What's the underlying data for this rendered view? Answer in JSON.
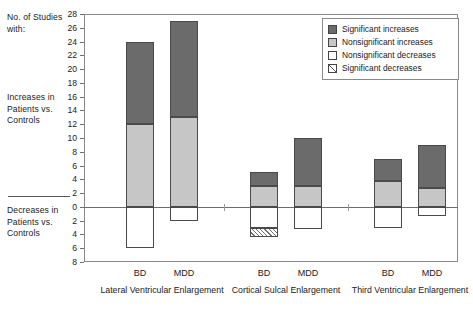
{
  "side_captions": {
    "top": "No. of Studies with:",
    "increases": "Increases in Patients vs. Controls",
    "decreases": "Decreases in Patients vs. Controls"
  },
  "legend": {
    "items": [
      {
        "label": "Significant increases",
        "key": "sig-inc",
        "color": "#6b6b6b"
      },
      {
        "label": "Nonsignificant increases",
        "key": "non-inc",
        "color": "#c6c6c6"
      },
      {
        "label": "Nonsignificant decreases",
        "key": "non-dec",
        "color": "#ffffff"
      },
      {
        "label": "Significant decreases",
        "key": "sig-dec",
        "color": "#ffffff"
      }
    ]
  },
  "chart_data": {
    "type": "bar",
    "title": "",
    "xlabel": "",
    "ylabel": "No. of Studies with:",
    "stacked": true,
    "grid": false,
    "legend_position": "top-right",
    "ylim": [
      -8,
      28
    ],
    "yticks": [
      28,
      26,
      24,
      22,
      20,
      18,
      16,
      14,
      12,
      10,
      8,
      6,
      4,
      2,
      0,
      2,
      4,
      6,
      8
    ],
    "ytick_values": [
      28,
      26,
      24,
      22,
      20,
      18,
      16,
      14,
      12,
      10,
      8,
      6,
      4,
      2,
      0,
      -2,
      -4,
      -6,
      -8
    ],
    "series": [
      {
        "name": "Significant increases",
        "values": [
          12,
          14,
          2,
          7,
          3.2,
          6.2
        ]
      },
      {
        "name": "Nonsignificant increases",
        "values": [
          12,
          13,
          3,
          3,
          3.8,
          2.8
        ]
      },
      {
        "name": "Nonsignificant decreases",
        "values": [
          -6,
          -2,
          -3,
          -3.2,
          -3,
          -1.3
        ]
      },
      {
        "name": "Significant decreases",
        "values": [
          0,
          0,
          -1.3,
          0,
          0,
          0
        ]
      }
    ],
    "categories": [
      "BD",
      "MDD",
      "BD",
      "MDD",
      "BD",
      "MDD"
    ],
    "groups": [
      {
        "label": "Lateral Ventricular Enlargement",
        "bars": [
          "BD",
          "MDD"
        ]
      },
      {
        "label": "Cortical Sulcal Enlargement",
        "bars": [
          "BD",
          "MDD"
        ]
      },
      {
        "label": "Third Ventricular Enlargement",
        "bars": [
          "BD",
          "MDD"
        ]
      }
    ],
    "bars": [
      {
        "group": "Lateral Ventricular Enlargement",
        "category": "BD",
        "sig_inc_top": 24,
        "non_inc_top": 12,
        "base": 0,
        "non_dec_bottom": -6,
        "sig_dec_bottom": -6
      },
      {
        "group": "Lateral Ventricular Enlargement",
        "category": "MDD",
        "sig_inc_top": 27,
        "non_inc_top": 13,
        "base": 0,
        "non_dec_bottom": -2,
        "sig_dec_bottom": -2
      },
      {
        "group": "Cortical Sulcal Enlargement",
        "category": "BD",
        "sig_inc_top": 5,
        "non_inc_top": 3,
        "base": 0,
        "non_dec_bottom": -3,
        "sig_dec_bottom": -4.3
      },
      {
        "group": "Cortical Sulcal Enlargement",
        "category": "MDD",
        "sig_inc_top": 10,
        "non_inc_top": 3,
        "base": 0,
        "non_dec_bottom": -3.2,
        "sig_dec_bottom": -3.2
      },
      {
        "group": "Third Ventricular Enlargement",
        "category": "BD",
        "sig_inc_top": 7,
        "non_inc_top": 3.8,
        "base": 0,
        "non_dec_bottom": -3,
        "sig_dec_bottom": -3
      },
      {
        "group": "Third Ventricular Enlargement",
        "category": "MDD",
        "sig_inc_top": 9,
        "non_inc_top": 2.8,
        "base": 0,
        "non_dec_bottom": -1.3,
        "sig_dec_bottom": -1.3
      }
    ]
  }
}
